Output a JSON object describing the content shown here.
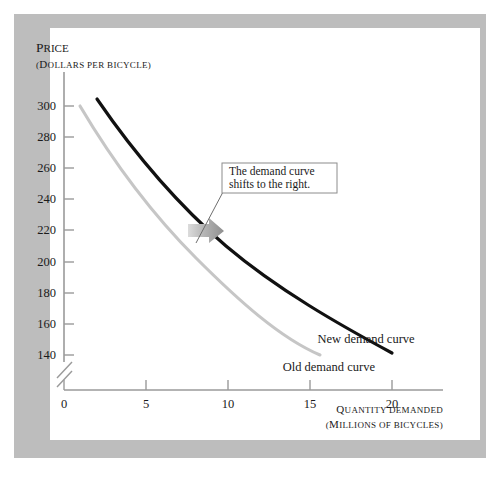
{
  "figure": {
    "frame_color": "#bdbdbd",
    "canvas_color": "#ffffff"
  },
  "chart_data": {
    "type": "line",
    "title": "",
    "xlabel": "QUANTITY DEMANDED",
    "xlabel_sub": "(MILLIONS OF BICYCLES)",
    "ylabel": "PRICE",
    "ylabel_sub": "(DOLLARS PER BICYCLE)",
    "xlim": [
      0,
      22
    ],
    "ylim": [
      130,
      310
    ],
    "xticks": [
      "0",
      "5",
      "10",
      "15",
      "20"
    ],
    "xtick_values": [
      0,
      5,
      10,
      15,
      20
    ],
    "yticks": [
      "140",
      "160",
      "180",
      "200",
      "220",
      "240",
      "260",
      "280",
      "300"
    ],
    "ytick_values": [
      140,
      160,
      180,
      200,
      220,
      240,
      260,
      280,
      300
    ],
    "grid": false,
    "axis_break": true,
    "legend": "inline-labels",
    "series": [
      {
        "name": "Old demand curve",
        "color": "#c6c6c6",
        "label": "Old demand curve",
        "x": [
          1.0,
          2.0,
          3.0,
          4.0,
          5.0,
          6.0,
          7.0,
          8.0,
          9.0,
          10.0,
          11.0,
          12.0,
          13.0,
          14.0,
          15.0,
          15.6
        ],
        "y": [
          300,
          281,
          265,
          250,
          237,
          225,
          214,
          204,
          195,
          186,
          178,
          170,
          162,
          154,
          145,
          140
        ]
      },
      {
        "name": "New demand curve",
        "color": "#111111",
        "label": "New demand curve",
        "x": [
          2.0,
          3.0,
          4.0,
          5.0,
          6.0,
          7.0,
          8.0,
          9.0,
          10.0,
          11.0,
          12.0,
          13.0,
          14.0,
          15.0,
          16.0,
          17.0,
          18.0,
          19.0,
          20.0
        ],
        "y": [
          305,
          288,
          274,
          261,
          250,
          240,
          231,
          223,
          215,
          208,
          201,
          194,
          188,
          182,
          176,
          170,
          165,
          161,
          157
        ]
      }
    ],
    "annotations": [
      {
        "name": "shift-callout",
        "line1": "The demand curve",
        "line2": "shifts to the right.",
        "border_color": "#8c8c8c"
      },
      {
        "name": "shift-arrow",
        "direction": "right",
        "color": "#9e9e9e"
      }
    ]
  }
}
